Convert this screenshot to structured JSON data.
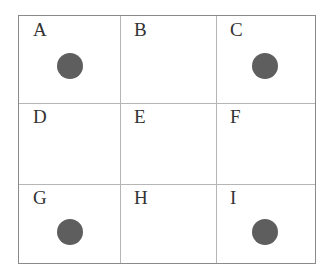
{
  "grid": {
    "rows": 3,
    "cols": 3,
    "cells": [
      {
        "label": "A",
        "dot": true
      },
      {
        "label": "B",
        "dot": false
      },
      {
        "label": "C",
        "dot": true
      },
      {
        "label": "D",
        "dot": false
      },
      {
        "label": "E",
        "dot": false
      },
      {
        "label": "F",
        "dot": false
      },
      {
        "label": "G",
        "dot": true
      },
      {
        "label": "H",
        "dot": false
      },
      {
        "label": "I",
        "dot": true
      }
    ]
  },
  "colors": {
    "dot": "#5e5e5e",
    "line": "#b5b5b5",
    "border": "#8a8a8a"
  }
}
